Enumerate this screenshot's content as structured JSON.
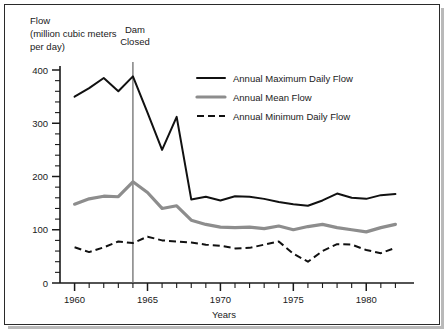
{
  "chart_data": {
    "type": "line",
    "title": "",
    "ylabel_lines": [
      "Flow",
      "(million cubic meters",
      "per day)"
    ],
    "xlabel": "Years",
    "x": [
      1960,
      1961,
      1962,
      1963,
      1964,
      1965,
      1966,
      1967,
      1968,
      1969,
      1970,
      1971,
      1972,
      1973,
      1974,
      1975,
      1976,
      1977,
      1978,
      1979,
      1980,
      1981,
      1982
    ],
    "xlim": [
      1959,
      1983
    ],
    "ylim": [
      0,
      400
    ],
    "xticks_major": [
      1960,
      1965,
      1970,
      1975,
      1980
    ],
    "xticks_major_labels": [
      "1960",
      "1965",
      "1970",
      "1975",
      "1980"
    ],
    "xtick_minor_step": 1,
    "yticks_major": [
      0,
      100,
      200,
      300,
      400
    ],
    "yticks_major_labels": [
      "0",
      "100",
      "200",
      "300",
      "400"
    ],
    "ytick_minor_step": 20,
    "grid": false,
    "legend_position": "upper-center-right",
    "series": [
      {
        "name": "Annual Maximum Daily Flow",
        "style": "solid",
        "color": "#111111",
        "values": [
          350,
          366,
          385,
          360,
          388,
          320,
          250,
          312,
          157,
          162,
          155,
          163,
          162,
          158,
          152,
          148,
          145,
          155,
          168,
          160,
          158,
          165,
          167
        ]
      },
      {
        "name": "Annual Mean Flow",
        "style": "solid-thick-gray",
        "color": "#8d8d8d",
        "values": [
          148,
          158,
          163,
          162,
          190,
          170,
          140,
          145,
          118,
          110,
          105,
          104,
          105,
          102,
          107,
          100,
          106,
          110,
          104,
          100,
          96,
          104,
          110
        ]
      },
      {
        "name": "Annual Minimum Daily Flow",
        "style": "dashed",
        "color": "#111111",
        "values": [
          67,
          58,
          67,
          78,
          75,
          87,
          80,
          78,
          76,
          72,
          70,
          65,
          66,
          72,
          78,
          55,
          40,
          60,
          73,
          72,
          62,
          56,
          66
        ]
      }
    ],
    "annotations": [
      {
        "name": "dam-closed",
        "text_lines": [
          "Dam",
          "Closed"
        ],
        "x": 1964,
        "type": "vertical-line-with-label"
      }
    ]
  },
  "legend": {
    "items": [
      {
        "label": "Annual Maximum Daily Flow",
        "style": "solid",
        "color": "#111111"
      },
      {
        "label": "Annual Mean Flow",
        "style": "solid-thick-gray",
        "color": "#8d8d8d"
      },
      {
        "label": "Annual Minimum Daily Flow",
        "style": "dashed",
        "color": "#111111"
      }
    ]
  }
}
